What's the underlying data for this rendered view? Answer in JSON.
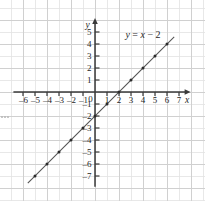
{
  "chart_data": {
    "type": "line",
    "title": "",
    "subtitle": "",
    "equation_label": "y = x − 2",
    "equation_label_at": [
      4.0,
      4.5
    ],
    "xlabel": "x",
    "ylabel": "y",
    "xlim": [
      -7,
      7.8
    ],
    "ylim": [
      -8,
      6
    ],
    "grid": true,
    "grid_step": 1,
    "legend": "none",
    "axis_arrows": [
      "x-positive",
      "y-positive"
    ],
    "x_ticks": [
      -6,
      -5,
      -4,
      -3,
      -2,
      -1,
      0,
      1,
      2,
      3,
      4,
      5,
      6,
      7
    ],
    "x_tick_labels": [
      "–6",
      "–5",
      "–4",
      "–3",
      "–2",
      "–1",
      "0",
      "1",
      "2",
      "3",
      "4",
      "5",
      "6",
      "7"
    ],
    "y_ticks": [
      -7,
      -6,
      -5,
      -4,
      -3,
      -2,
      -1,
      1,
      2,
      3,
      4,
      5
    ],
    "y_tick_labels": [
      "–7",
      "–6",
      "–5",
      "–4",
      "–3",
      "–2",
      "–1",
      "1",
      "2",
      "3",
      "4",
      "5"
    ],
    "origin_label": "0",
    "series": [
      {
        "name": "y = x - 2",
        "slope": 1,
        "intercept": -2,
        "x_intercept": 2,
        "y_intercept": -2,
        "line_from": [
          -5.6,
          -7.6
        ],
        "line_to": [
          6.6,
          4.6
        ],
        "marker": "dot",
        "points": [
          [
            -5,
            -7
          ],
          [
            -4,
            -6
          ],
          [
            -3,
            -5
          ],
          [
            -2,
            -4
          ],
          [
            -1,
            -3
          ],
          [
            0,
            -2
          ],
          [
            1,
            -1
          ],
          [
            2,
            0
          ],
          [
            3,
            1
          ],
          [
            4,
            2
          ],
          [
            5,
            3
          ],
          [
            6,
            4
          ]
        ]
      }
    ],
    "colors": {
      "grid_minor": "#e2e2e2",
      "grid_major": "#d0d0d0",
      "axis": "#3a3a3a",
      "line": "#555555",
      "marker": "#2b2b2b",
      "text": "#1f1f1f",
      "background": "#ffffff"
    }
  }
}
